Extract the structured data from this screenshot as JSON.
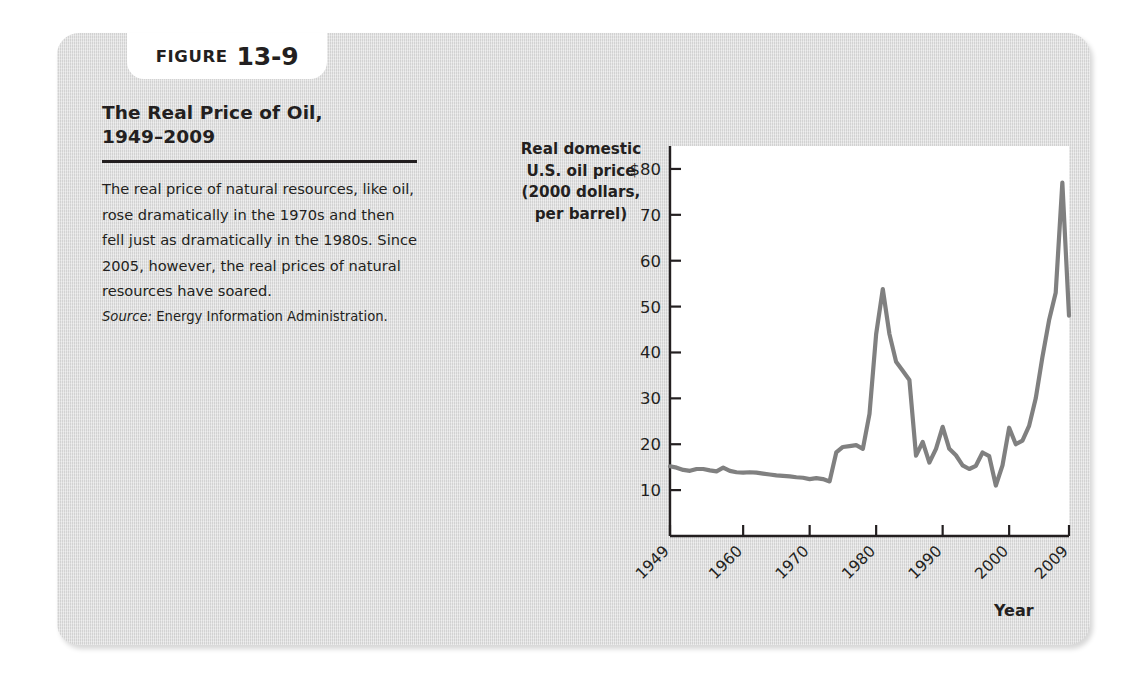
{
  "figure": {
    "badge_word": "FIGURE",
    "badge_number": "13-9",
    "title": "The Real Price of Oil,\n1949–2009",
    "body": "The real price of natural resources, like oil, rose dramatically in the 1970s and then fell just as dramatically in the 1980s. Since 2005, however, the real prices of natural resources have soared.",
    "source_label": "Source:",
    "source_text": "Energy Information Administration."
  },
  "colors": {
    "card_background": "#d9d9d9",
    "badge_background": "#ffffff",
    "plot_background": "#ffffff",
    "line": "#808080",
    "axis": "#231f20",
    "text": "#231f20"
  },
  "chart_data": {
    "type": "line",
    "title": "The Real Price of Oil, 1949–2009",
    "xlabel": "Year",
    "ylabel": "Real domestic\nU.S. oil price\n(2000 dollars,\nper barrel)",
    "ylabel_lines": [
      "Real domestic",
      "U.S. oil price",
      "(2000 dollars,",
      "per barrel)"
    ],
    "xlim": [
      1949,
      2009
    ],
    "ylim": [
      0,
      85
    ],
    "grid": false,
    "legend": null,
    "ytick_values": [
      80,
      70,
      60,
      50,
      40,
      30,
      20,
      10
    ],
    "ytick_labels": [
      "$80",
      "70",
      "60",
      "50",
      "40",
      "30",
      "20",
      "10"
    ],
    "xtick_values": [
      1949,
      1960,
      1970,
      1980,
      1990,
      2000,
      2009
    ],
    "xtick_labels": [
      "1949",
      "1960",
      "1970",
      "1980",
      "1990",
      "2000",
      "2009"
    ],
    "series": [
      {
        "name": "Real domestic U.S. oil price (2000 dollars per barrel)",
        "x": [
          1949,
          1950,
          1951,
          1952,
          1953,
          1954,
          1955,
          1956,
          1957,
          1958,
          1959,
          1960,
          1961,
          1962,
          1963,
          1964,
          1965,
          1966,
          1967,
          1968,
          1969,
          1970,
          1971,
          1972,
          1973,
          1974,
          1975,
          1976,
          1977,
          1978,
          1979,
          1980,
          1981,
          1982,
          1983,
          1984,
          1985,
          1986,
          1987,
          1988,
          1989,
          1990,
          1991,
          1992,
          1993,
          1994,
          1995,
          1996,
          1997,
          1998,
          1999,
          2000,
          2001,
          2002,
          2003,
          2004,
          2005,
          2006,
          2007,
          2008,
          2009
        ],
        "values": [
          15.2,
          14.9,
          14.4,
          14.2,
          14.6,
          14.6,
          14.3,
          14.1,
          14.9,
          14.2,
          13.9,
          13.8,
          13.9,
          13.8,
          13.6,
          13.4,
          13.2,
          13.1,
          13.0,
          12.8,
          12.7,
          12.4,
          12.6,
          12.4,
          11.9,
          18.2,
          19.4,
          19.6,
          19.8,
          19.0,
          26.6,
          44.0,
          53.8,
          44.0,
          38.0,
          36.0,
          34.0,
          17.5,
          20.5,
          16.0,
          19.0,
          23.8,
          19.0,
          17.6,
          15.4,
          14.6,
          15.3,
          18.2,
          17.4,
          11.0,
          15.4,
          23.6,
          20.0,
          20.8,
          24.0,
          30.0,
          39.0,
          47.0,
          53.0,
          77.0,
          48.0
        ]
      }
    ],
    "annotations": [
      {
        "label": "1981 peak",
        "x": 1981,
        "y": 53.8
      },
      {
        "label": "1998 trough",
        "x": 1998,
        "y": 11.0
      },
      {
        "label": "2008 peak",
        "x": 2008,
        "y": 77.0
      },
      {
        "label": "2009 drop",
        "x": 2009,
        "y": 48.0
      }
    ]
  }
}
